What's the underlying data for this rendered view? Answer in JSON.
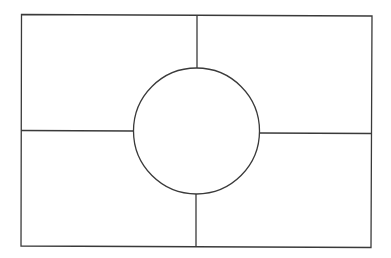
{
  "diagram": {
    "type": "four-quadrant frame with central circle",
    "width": 391,
    "height": 258,
    "background": "#ffffff",
    "stroke_color": "#3a3a3a",
    "stroke_width": 1.3,
    "frame": {
      "top_left": [
        21.5,
        14.5
      ],
      "top_right": [
        372,
        16
      ],
      "bottom_right": [
        371,
        247.5
      ],
      "bottom_left": [
        21,
        246
      ]
    },
    "circle": {
      "cx": 196.5,
      "cy": 131,
      "r": 63
    },
    "dividers": {
      "top_vertical": {
        "x1": 197,
        "y1": 15,
        "x2": 197,
        "y2": 68
      },
      "bottom_vertical": {
        "x1": 196,
        "y1": 194,
        "x2": 196,
        "y2": 247
      },
      "left_horizontal": {
        "x1": 21,
        "y1": 130.5,
        "x2": 133.5,
        "y2": 131
      },
      "right_horizontal": {
        "x1": 259.5,
        "y1": 133,
        "x2": 371.5,
        "y2": 133.5
      }
    },
    "regions": [
      {
        "name": "top-left-quadrant",
        "label": ""
      },
      {
        "name": "top-right-quadrant",
        "label": ""
      },
      {
        "name": "bottom-left-quadrant",
        "label": ""
      },
      {
        "name": "bottom-right-quadrant",
        "label": ""
      },
      {
        "name": "center-circle",
        "label": ""
      }
    ]
  }
}
